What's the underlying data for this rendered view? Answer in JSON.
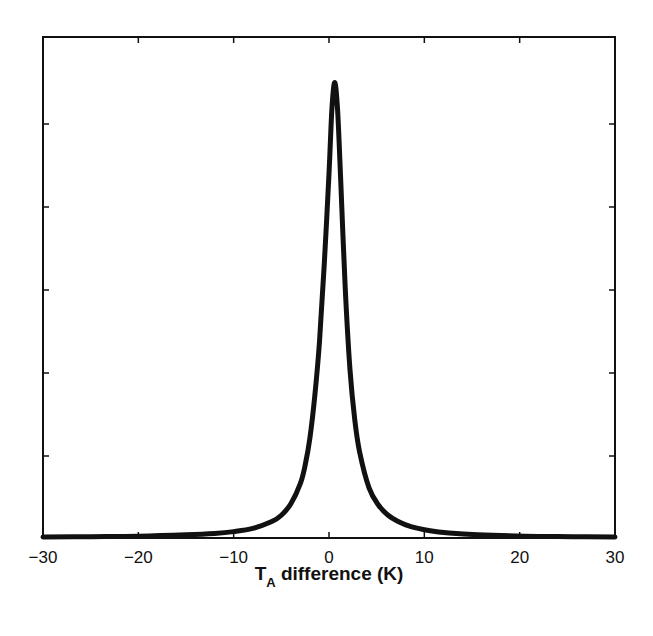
{
  "chart_data": {
    "type": "line",
    "title": "",
    "xlabel": "T_A difference (K)",
    "xlabel_main": "T",
    "xlabel_sub": "A",
    "xlabel_rest": " difference (K)",
    "ylabel": "",
    "xlim": [
      -30,
      30
    ],
    "ylim": [
      0,
      1.1
    ],
    "x_ticks": [
      -30,
      -20,
      -10,
      0,
      10,
      20,
      30
    ],
    "x_tick_labels": [
      "−30",
      "−20",
      "−10",
      "0",
      "10",
      "20",
      "30"
    ],
    "y_ticks": [
      0.2,
      0.4,
      0.6,
      0.8,
      1.0
    ],
    "y_tick_labels": [
      "",
      "",
      "",
      "",
      ""
    ],
    "grid": false,
    "legend": null,
    "series": [
      {
        "name": "distribution",
        "color": "#111111",
        "x": [
          -30,
          -25,
          -20,
          -15,
          -12,
          -10,
          -8,
          -6,
          -5,
          -4,
          -3,
          -2.5,
          -2,
          -1.5,
          -1,
          -0.5,
          0,
          0.3,
          0.6,
          0.9,
          1.2,
          1.7,
          2.2,
          2.7,
          3.2,
          4.2,
          5.2,
          6.2,
          7.2,
          8.6,
          10.6,
          12.6,
          15.6,
          20.6,
          25.6,
          30
        ],
        "values": [
          0.002,
          0.003,
          0.004,
          0.007,
          0.01,
          0.014,
          0.021,
          0.036,
          0.05,
          0.075,
          0.12,
          0.16,
          0.22,
          0.31,
          0.43,
          0.6,
          0.8,
          0.94,
          1.0,
          0.94,
          0.8,
          0.55,
          0.37,
          0.26,
          0.19,
          0.11,
          0.072,
          0.05,
          0.037,
          0.025,
          0.016,
          0.011,
          0.007,
          0.004,
          0.003,
          0.002
        ]
      }
    ]
  }
}
